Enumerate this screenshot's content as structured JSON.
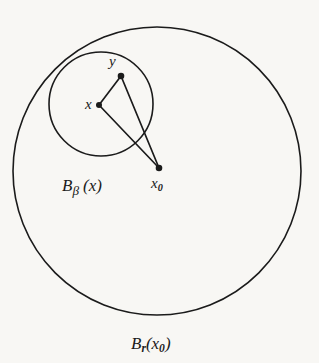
{
  "figure": {
    "background_color": "#f8f7f4",
    "stroke_color": "#1b1b1b",
    "width": 319,
    "height": 363
  },
  "chart_data": {
    "type": "diagram",
    "title": "",
    "circles": [
      {
        "name": "large-ball",
        "label": "B_r(x_0)",
        "label_base": "B",
        "label_subscript": "r",
        "label_arg": "(x_0)",
        "cx": 157,
        "cy": 171,
        "r": 144,
        "stroke": "#1b1b1b",
        "stroke_width": 1.6,
        "fill": "none"
      },
      {
        "name": "small-ball",
        "label": "B_beta (x)",
        "label_base": "B",
        "label_subscript": "β",
        "label_arg": "(x)",
        "cx": 101,
        "cy": 104,
        "r": 52,
        "stroke": "#1b1b1b",
        "stroke_width": 1.6,
        "fill": "none"
      }
    ],
    "points": [
      {
        "name": "x",
        "label": "x",
        "cx": 99,
        "cy": 105,
        "dot_r": 3.0,
        "label_dx": -14,
        "label_dy": -8
      },
      {
        "name": "y",
        "label": "y",
        "cx": 121,
        "cy": 76,
        "dot_r": 3.3,
        "label_dx": -12,
        "label_dy": -22
      },
      {
        "name": "x0",
        "label": "x_0",
        "cx": 159,
        "cy": 168,
        "dot_r": 3.3,
        "label_dx": -8,
        "label_dy": 8
      }
    ],
    "segments": [
      {
        "name": "x-to-y",
        "x1": 99,
        "y1": 105,
        "x2": 121,
        "y2": 76,
        "stroke_width": 1.7
      },
      {
        "name": "x-to-x0",
        "x1": 99,
        "y1": 105,
        "x2": 159,
        "y2": 168,
        "stroke_width": 1.7
      },
      {
        "name": "y-to-x0",
        "x1": 121,
        "y1": 76,
        "x2": 159,
        "y2": 168,
        "stroke_width": 1.7
      }
    ]
  },
  "labels": {
    "point_x": "x",
    "point_y": "y",
    "point_x0_base": "x",
    "point_x0_sub": "0",
    "small_ball_base": "B",
    "small_ball_sub": "β",
    "small_ball_arg_open": "(",
    "small_ball_arg_var": "x",
    "small_ball_arg_close": ")",
    "large_ball_base": "B",
    "large_ball_sub": "r",
    "large_ball_arg_open": "(",
    "large_ball_arg_var": "x",
    "large_ball_arg_var_sub": "0",
    "large_ball_arg_close": ")"
  }
}
